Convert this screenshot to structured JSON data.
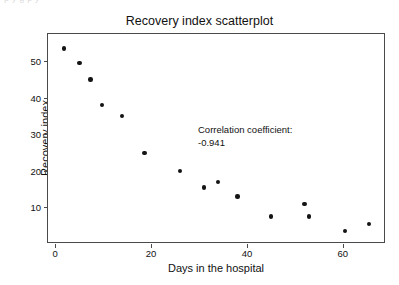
{
  "artifact": {
    "clipped_top_text": "p    y   g                p                     y"
  },
  "chart_data": {
    "type": "scatter",
    "title": "Recovery index scatterplot",
    "xlabel": "Days in the hospital",
    "ylabel": "Recovery index",
    "xlim": [
      -1.5,
      69
    ],
    "ylim": [
      0.0,
      57.5
    ],
    "xticks": [
      0,
      20,
      40,
      60
    ],
    "xtick_labels": [
      "0",
      "20",
      "40",
      "60"
    ],
    "yticks": [
      10,
      20,
      30,
      40,
      50
    ],
    "ytick_labels": [
      "10",
      "20",
      "30",
      "40",
      "50"
    ],
    "grid": false,
    "legend": null,
    "marker": {
      "shape": "circle",
      "color": "#141414",
      "size_px": 4.4
    },
    "frame_color": "#4a4a4a",
    "background": "#ffffff",
    "x": [
      1.8,
      5.1,
      7.4,
      9.8,
      13.9,
      18.6,
      26.0,
      31.0,
      34.0,
      38.0,
      45.0,
      52.0,
      53.0,
      60.5,
      65.5
    ],
    "y": [
      53.5,
      49.5,
      45.0,
      38.0,
      35.0,
      25.0,
      20.0,
      15.5,
      17.0,
      13.0,
      7.5,
      11.0,
      7.5,
      3.5,
      5.5
    ],
    "points": [
      {
        "x": 1.8,
        "y": 53.5
      },
      {
        "x": 5.1,
        "y": 49.5
      },
      {
        "x": 7.4,
        "y": 45.0
      },
      {
        "x": 9.8,
        "y": 38.0
      },
      {
        "x": 13.9,
        "y": 35.0
      },
      {
        "x": 18.6,
        "y": 25.0
      },
      {
        "x": 26.0,
        "y": 20.0
      },
      {
        "x": 31.0,
        "y": 15.5
      },
      {
        "x": 34.0,
        "y": 17.0
      },
      {
        "x": 38.0,
        "y": 13.0
      },
      {
        "x": 45.0,
        "y": 7.5
      },
      {
        "x": 52.0,
        "y": 11.0
      },
      {
        "x": 53.0,
        "y": 7.5
      },
      {
        "x": 60.5,
        "y": 3.5
      },
      {
        "x": 65.5,
        "y": 5.5
      }
    ],
    "annotations": [
      {
        "line1": "Correlation coefficient:",
        "line2": "-0.941",
        "x": 28,
        "y": 28
      }
    ]
  }
}
